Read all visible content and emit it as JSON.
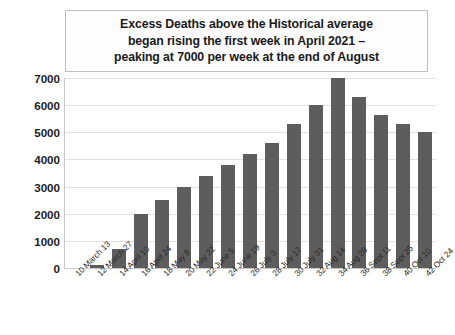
{
  "chart_data": {
    "type": "bar",
    "title": "Excess Deaths above the Historical average\nbegan rising the first week in April 2021 –\npeaking at 7000 per week at the end of August",
    "xlabel": "",
    "ylabel": "",
    "ylim": [
      0,
      7000
    ],
    "yticks": [
      0,
      1000,
      2000,
      3000,
      4000,
      5000,
      6000,
      7000
    ],
    "ytick_labels": [
      "0",
      "1000",
      "2000",
      "3000",
      "4000",
      "5000",
      "6000",
      "7000"
    ],
    "grid": true,
    "legend": null,
    "bar_color": "#5d5d5d",
    "categories": [
      "10 March 13",
      "12 March 27",
      "14 April 10",
      "16 April 24",
      "18 May 8",
      "20 May 22",
      "22 June 5",
      "24 June 19",
      "26 July 3",
      "28 July 17",
      "30 July 31",
      "32 Aug 14",
      "34 Aug 28",
      "36 Sept 11",
      "38 Sept 25",
      "40 Oct 10",
      "42 Oct 24"
    ],
    "values": [
      0,
      120,
      700,
      2000,
      2500,
      3000,
      3400,
      3800,
      4200,
      4600,
      5300,
      6000,
      7000,
      6300,
      5650,
      5300,
      5000
    ]
  }
}
